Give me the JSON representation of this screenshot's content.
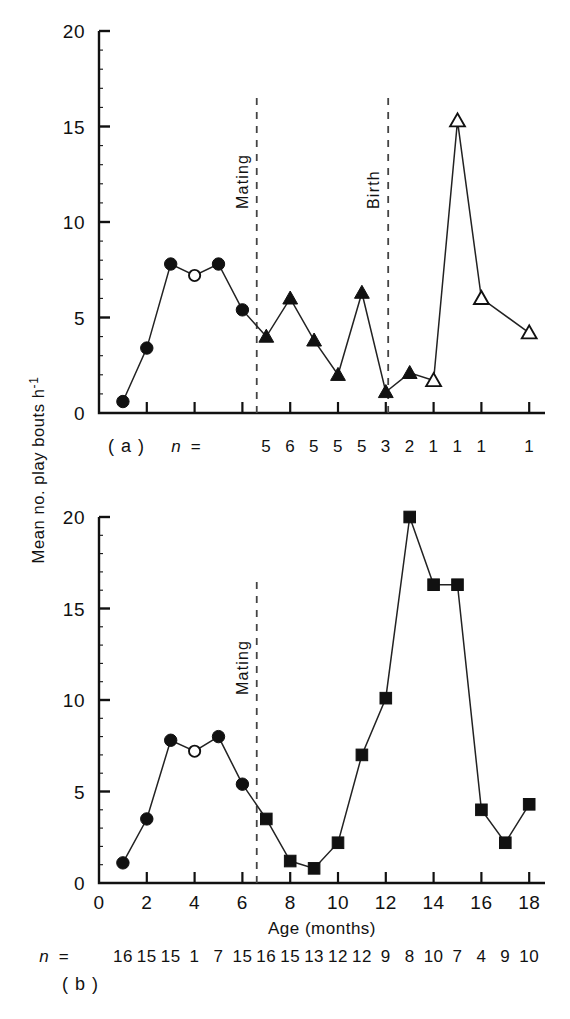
{
  "figure": {
    "y_axis_label": "Mean no. play bouts h",
    "y_axis_label_sup": "-1",
    "x_axis_label": "Age (months)",
    "n_prefix": "n",
    "n_equals": "=",
    "event_mating": "Mating",
    "event_birth": "Birth",
    "panel_a_label": "( a )",
    "panel_b_label": "( b )",
    "tick_colors": "#111111"
  },
  "chart_data": [
    {
      "type": "line",
      "panel": "a",
      "title": "",
      "xlabel": "",
      "ylabel": "Mean no. play bouts h-1",
      "xlim": [
        0,
        19
      ],
      "ylim": [
        0,
        20
      ],
      "xticks": [
        0,
        2,
        4,
        6,
        8,
        10,
        12,
        14,
        16,
        18
      ],
      "xticklabels": [
        "",
        "",
        "",
        "",
        "",
        "",
        "",
        "",
        "",
        ""
      ],
      "yticks": [
        0,
        5,
        10,
        15,
        20
      ],
      "yticklabels": [
        "0",
        "5",
        "10",
        "15",
        "20"
      ],
      "grid": false,
      "legend": "none",
      "annotations": [
        {
          "text": "Mating",
          "x": 6.6,
          "type": "vertical-dashed-line"
        },
        {
          "text": "Birth",
          "x": 12.1,
          "type": "vertical-dashed-line"
        }
      ],
      "series": [
        {
          "name": "pre-mating (filled circles)",
          "marker": "filled-circle",
          "x": [
            1,
            2,
            3,
            4,
            5,
            6
          ],
          "values": [
            0.6,
            3.4,
            7.8,
            7.2,
            7.8,
            5.4
          ],
          "marker_overrides": {
            "4": "open-circle"
          }
        },
        {
          "name": "pregnancy (filled triangles)",
          "marker": "filled-triangle",
          "x": [
            7,
            8,
            9,
            10,
            11,
            12,
            13
          ],
          "values": [
            4.0,
            6.0,
            3.8,
            2.0,
            6.3,
            1.1,
            2.1
          ]
        },
        {
          "name": "post-birth (open triangles)",
          "marker": "open-triangle",
          "x": [
            14,
            15,
            16,
            18
          ],
          "values": [
            1.7,
            15.3,
            6.0,
            4.2
          ]
        }
      ],
      "n_values": [
        "5",
        "6",
        "5",
        "5",
        "5",
        "3",
        "2",
        "1",
        "1",
        "1",
        "1"
      ],
      "n_x": [
        7,
        8,
        9,
        10,
        11,
        12,
        13,
        14,
        15,
        16,
        18
      ]
    },
    {
      "type": "line",
      "panel": "b",
      "title": "",
      "xlabel": "Age (months)",
      "ylabel": "Mean no. play bouts h-1",
      "xlim": [
        0,
        19
      ],
      "ylim": [
        0,
        20
      ],
      "xticks": [
        0,
        2,
        4,
        6,
        8,
        10,
        12,
        14,
        16,
        18
      ],
      "xticklabels": [
        "0",
        "2",
        "4",
        "6",
        "8",
        "10",
        "12",
        "14",
        "16",
        "18"
      ],
      "yticks": [
        0,
        5,
        10,
        15,
        20
      ],
      "yticklabels": [
        "0",
        "5",
        "10",
        "15",
        "20"
      ],
      "grid": false,
      "legend": "none",
      "annotations": [
        {
          "text": "Mating",
          "x": 6.6,
          "type": "vertical-dashed-line"
        }
      ],
      "series": [
        {
          "name": "pre-mating (filled circles)",
          "marker": "filled-circle",
          "x": [
            1,
            2,
            3,
            4,
            5,
            6
          ],
          "values": [
            1.1,
            3.5,
            7.8,
            7.2,
            8.0,
            5.4
          ],
          "marker_overrides": {
            "4": "open-circle"
          }
        },
        {
          "name": "post-mating (filled squares)",
          "marker": "filled-square",
          "x": [
            7,
            8,
            9,
            10,
            11,
            12,
            13,
            14,
            15,
            16,
            17,
            18
          ],
          "values": [
            3.5,
            1.2,
            0.8,
            2.2,
            7.0,
            10.1,
            20.0,
            16.3,
            16.3,
            4.0,
            2.2,
            4.3
          ]
        }
      ],
      "n_values": [
        "16",
        "15",
        "15",
        "1",
        "7",
        "15",
        "16",
        "15",
        "13",
        "12",
        "12",
        "9",
        "8",
        "10",
        "7",
        "4",
        "9",
        "10"
      ],
      "n_x": [
        1,
        2,
        3,
        4,
        5,
        6,
        7,
        8,
        9,
        10,
        11,
        12,
        13,
        14,
        15,
        16,
        17,
        18
      ]
    }
  ]
}
